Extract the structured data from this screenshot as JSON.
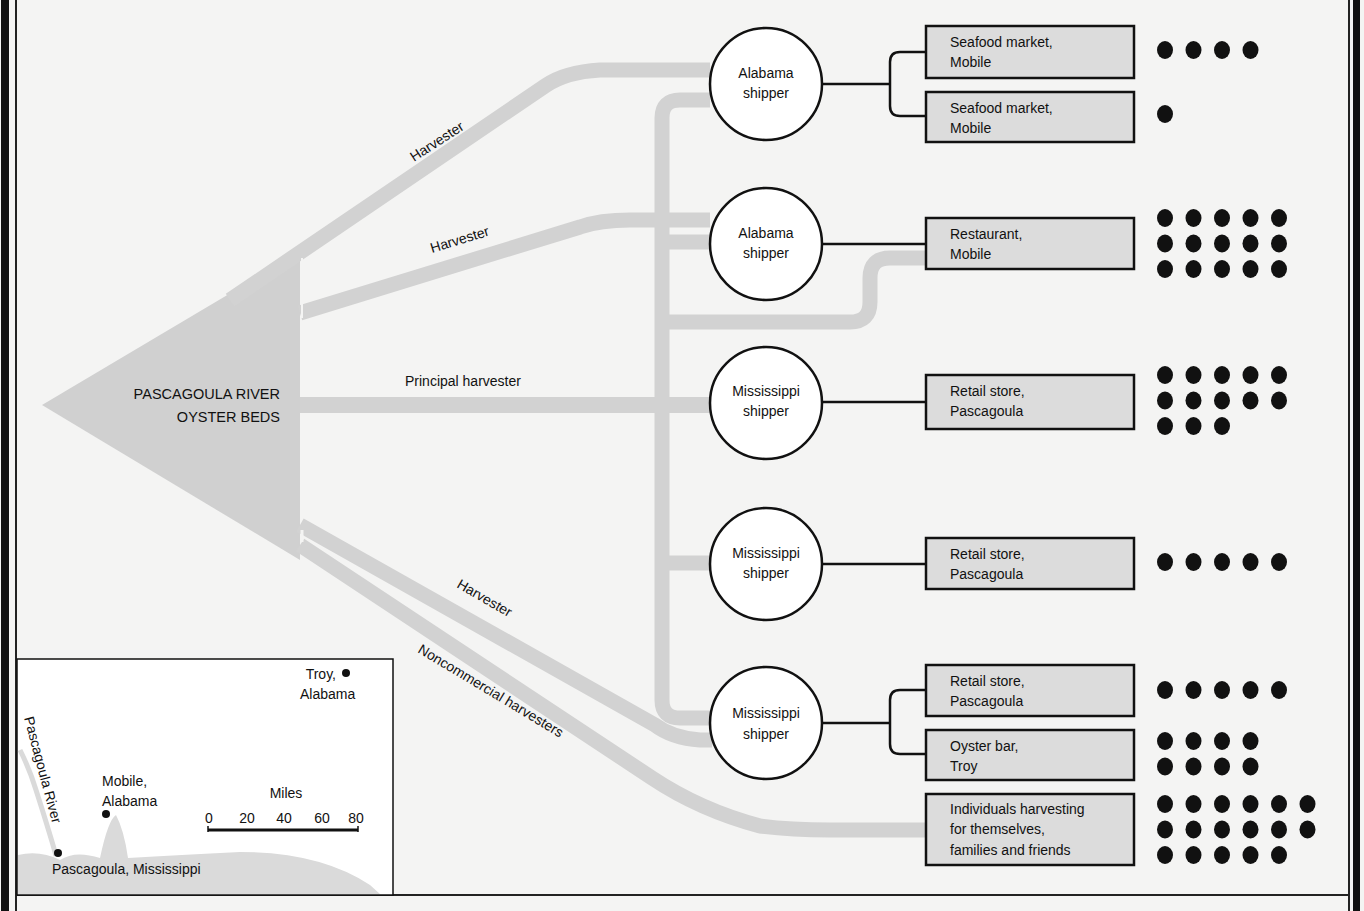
{
  "colors": {
    "background": "#f4f4f3",
    "flow": "#d2d2d2",
    "flow_dark": "#cbcbcb",
    "box_fill": "#dcdcdc",
    "ink": "#111111",
    "map_land": "#dadada",
    "map_bg": "#ffffff"
  },
  "source": {
    "label_line1": "PASCAGOULA RIVER",
    "label_line2": "OYSTER BEDS"
  },
  "flow_labels": {
    "harvester_top": "Harvester",
    "harvester_mid": "Harvester",
    "principal": "Principal harvester",
    "harvester_low": "Harvester",
    "noncommercial": "Noncommercial harvesters"
  },
  "shippers": [
    {
      "line1": "Alabama",
      "line2": "shipper"
    },
    {
      "line1": "Alabama",
      "line2": "shipper"
    },
    {
      "line1": "Mississippi",
      "line2": "shipper"
    },
    {
      "line1": "Mississippi",
      "line2": "shipper"
    },
    {
      "line1": "Mississippi",
      "line2": "shipper"
    }
  ],
  "destinations": [
    {
      "line1": "Seafood market,",
      "line2": "Mobile",
      "line3": "",
      "dots": 4,
      "dot_rows": [
        4
      ]
    },
    {
      "line1": "Seafood market,",
      "line2": "Mobile",
      "line3": "",
      "dots": 1,
      "dot_rows": [
        1
      ]
    },
    {
      "line1": "Restaurant,",
      "line2": "Mobile",
      "line3": "",
      "dots": 15,
      "dot_rows": [
        5,
        5,
        5
      ]
    },
    {
      "line1": "Retail store,",
      "line2": "Pascagoula",
      "line3": "",
      "dots": 13,
      "dot_rows": [
        5,
        5,
        3
      ]
    },
    {
      "line1": "Retail store,",
      "line2": "Pascagoula",
      "line3": "",
      "dots": 5,
      "dot_rows": [
        5
      ]
    },
    {
      "line1": "Retail store,",
      "line2": "Pascagoula",
      "line3": "",
      "dots": 5,
      "dot_rows": [
        5
      ]
    },
    {
      "line1": "Oyster bar,",
      "line2": "Troy",
      "line3": "",
      "dots": 8,
      "dot_rows": [
        4,
        4
      ]
    },
    {
      "line1": "Individuals harvesting",
      "line2": "for themselves,",
      "line3": "families and friends",
      "dots": 17,
      "dot_rows": [
        6,
        6,
        5
      ]
    }
  ],
  "map_inset": {
    "troy_line1": "Troy,",
    "troy_line2": "Alabama",
    "mobile_line1": "Mobile,",
    "mobile_line2": "Alabama",
    "pascagoula": "Pascagoula, Mississippi",
    "river": "Pascagoula River",
    "scale_title": "Miles",
    "scale_ticks": [
      "0",
      "20",
      "40",
      "60",
      "80"
    ]
  }
}
